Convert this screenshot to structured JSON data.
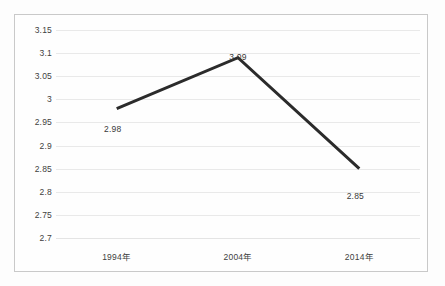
{
  "chart_data": {
    "type": "line",
    "title": "",
    "subtitle": "",
    "xlabel": "",
    "ylabel": "",
    "categories": [
      "1994年",
      "2004年",
      "2014年"
    ],
    "values": [
      2.98,
      3.09,
      2.85
    ],
    "point_labels": [
      "2.98",
      "3.09",
      "2.85"
    ],
    "ylim": [
      2.7,
      3.15
    ],
    "ytick_step": 0.05,
    "ytick_labels": [
      "3.15",
      "3.1",
      "3.05",
      "3",
      "2.95",
      "2.9",
      "2.85",
      "2.8",
      "2.75",
      "2.7"
    ],
    "ytick_values": [
      3.15,
      3.1,
      3.05,
      3.0,
      2.95,
      2.9,
      2.85,
      2.8,
      2.75,
      2.7
    ],
    "grid": true,
    "legend": false,
    "legend_position": "none",
    "series": [
      {
        "name": "",
        "values": [
          2.98,
          3.09,
          2.85
        ]
      }
    ],
    "colors": {
      "line": "#2b2b2b",
      "gridline": "#e9e9e9",
      "frame_border": "#c9c9c9",
      "text": "#3f3f3f",
      "plot_background": "#fefefe"
    },
    "line_width_px": 3,
    "markers": false
  }
}
